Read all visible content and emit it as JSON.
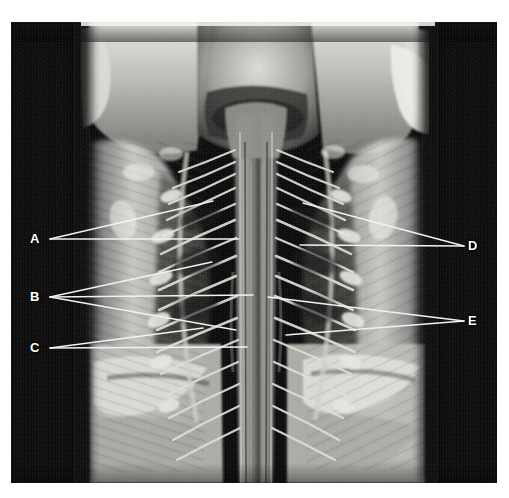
{
  "figure": {
    "kind": "anatomical-dissection-photograph",
    "caption": "",
    "plate": {
      "background_color": "#0a0a0a",
      "page_color": "#ffffff",
      "left": 11,
      "top": 22,
      "width": 486,
      "height": 461
    },
    "label_color": "#ffffff",
    "leader_color": "#f2f2f2"
  },
  "labels": [
    {
      "id": "A",
      "text": "A",
      "side": "left",
      "x": 30,
      "y": 232,
      "anchor_x": 50,
      "anchor_y": 239,
      "lines": 2
    },
    {
      "id": "B",
      "text": "B",
      "side": "left",
      "x": 30,
      "y": 290,
      "anchor_x": 50,
      "anchor_y": 297,
      "lines": 3
    },
    {
      "id": "C",
      "text": "C",
      "side": "left",
      "x": 30,
      "y": 341,
      "anchor_x": 50,
      "anchor_y": 348,
      "lines": 2
    },
    {
      "id": "D",
      "text": "D",
      "side": "right",
      "x": 468,
      "y": 239,
      "anchor_x": 464,
      "anchor_y": 246,
      "lines": 2
    },
    {
      "id": "E",
      "text": "E",
      "side": "right",
      "x": 468,
      "y": 314,
      "anchor_x": 464,
      "anchor_y": 321,
      "lines": 2
    }
  ],
  "leader_paths": [
    {
      "label": "A",
      "from_x": 50,
      "from_y": 239,
      "to_x": 213,
      "to_y": 201
    },
    {
      "label": "A",
      "from_x": 50,
      "from_y": 239,
      "to_x": 239,
      "to_y": 239
    },
    {
      "label": "B",
      "from_x": 50,
      "from_y": 297,
      "to_x": 212,
      "to_y": 262
    },
    {
      "label": "B",
      "from_x": 50,
      "from_y": 297,
      "to_x": 253,
      "to_y": 295
    },
    {
      "label": "B",
      "from_x": 50,
      "from_y": 297,
      "to_x": 236,
      "to_y": 330
    },
    {
      "label": "C",
      "from_x": 50,
      "from_y": 348,
      "to_x": 203,
      "to_y": 328
    },
    {
      "label": "C",
      "from_x": 50,
      "from_y": 348,
      "to_x": 247,
      "to_y": 347
    },
    {
      "label": "D",
      "from_x": 464,
      "from_y": 246,
      "to_x": 303,
      "to_y": 203
    },
    {
      "label": "D",
      "from_x": 464,
      "from_y": 246,
      "to_x": 300,
      "to_y": 245
    },
    {
      "label": "E",
      "from_x": 464,
      "from_y": 321,
      "to_x": 268,
      "to_y": 297
    },
    {
      "label": "E",
      "from_x": 464,
      "from_y": 321,
      "to_x": 286,
      "to_y": 335
    }
  ]
}
